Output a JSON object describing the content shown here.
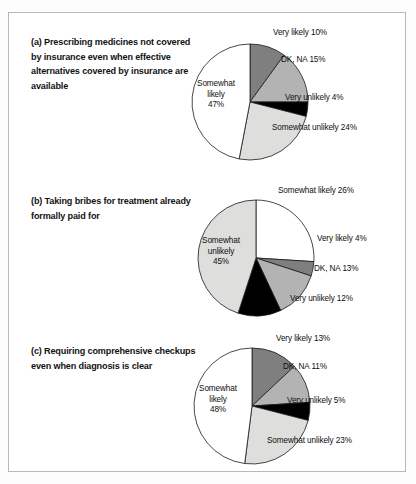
{
  "figure": {
    "panels": [
      {
        "id": "a",
        "title": "(a)  Prescribing medicines not covered by insurance even when effective alternatives covered by insurance are available",
        "inner_label_line1": "Somewhat",
        "inner_label_line2": "likely",
        "inner_label_line3": "47%",
        "labels": [
          {
            "text": "Very likely 10%"
          },
          {
            "text": "DK, NA 15%"
          },
          {
            "text": "Very unlikely 4%"
          },
          {
            "text": "Somewhat unlikely 24%"
          }
        ]
      },
      {
        "id": "b",
        "title": "(b)  Taking bribes for treatment already formally paid for",
        "inner_label_line1": "Somewhat",
        "inner_label_line2": "unlikely",
        "inner_label_line3": "45%",
        "labels": [
          {
            "text": "Somewhat likely 26%"
          },
          {
            "text": "Very likely 4%"
          },
          {
            "text": "DK, NA 13%"
          },
          {
            "text": "Very unlikely 12%"
          }
        ]
      },
      {
        "id": "c",
        "title": "(c)  Requiring comprehensive checkups even when diagnosis is clear",
        "inner_label_line1": "Somewhat",
        "inner_label_line2": "likely",
        "inner_label_line3": "48%",
        "labels": [
          {
            "text": "Very likely 13%"
          },
          {
            "text": "DK, NA 11%"
          },
          {
            "text": "Very unlikely 5%"
          },
          {
            "text": "Somewhat unlikely 23%"
          }
        ]
      }
    ]
  },
  "chart_data": [
    {
      "type": "pie",
      "title": "(a)  Prescribing medicines not covered by insurance even when effective alternatives covered by insurance are available",
      "categories": [
        "Very likely",
        "DK, NA",
        "Very unlikely",
        "Somewhat unlikely",
        "Somewhat likely"
      ],
      "values": [
        10,
        15,
        4,
        24,
        47
      ],
      "labels": [
        "Very likely 10%",
        "DK, NA 15%",
        "Very unlikely 4%",
        "Somewhat unlikely 24%",
        "Somewhat likely 47%"
      ],
      "colors": [
        "#807f7f",
        "#b4b3b3",
        "#000000",
        "#dededd",
        "#ffffff"
      ],
      "start_angle_deg": 0,
      "direction": "clockwise",
      "legend": "none"
    },
    {
      "type": "pie",
      "title": "(b)  Taking bribes for treatment already formally paid for",
      "categories": [
        "Somewhat likely",
        "Very likely",
        "DK, NA",
        "Very unlikely",
        "Somewhat unlikely"
      ],
      "values": [
        26,
        4,
        13,
        12,
        45
      ],
      "labels": [
        "Somewhat likely 26%",
        "Very likely 4%",
        "DK, NA 13%",
        "Very unlikely 12%",
        "Somewhat unlikely 45%"
      ],
      "colors": [
        "#ffffff",
        "#807f7f",
        "#b4b3b3",
        "#000000",
        "#dededd"
      ],
      "start_angle_deg": 0,
      "direction": "clockwise",
      "legend": "none"
    },
    {
      "type": "pie",
      "title": "(c)  Requiring comprehensive checkups even when diagnosis is clear",
      "categories": [
        "Very likely",
        "DK, NA",
        "Very unlikely",
        "Somewhat unlikely",
        "Somewhat likely"
      ],
      "values": [
        13,
        11,
        5,
        23,
        48
      ],
      "labels": [
        "Very likely 13%",
        "DK, NA 11%",
        "Very unlikely 5%",
        "Somewhat unlikely 23%",
        "Somewhat likely 48%"
      ],
      "colors": [
        "#807f7f",
        "#b4b3b3",
        "#000000",
        "#dededd",
        "#ffffff"
      ],
      "start_angle_deg": 0,
      "direction": "clockwise",
      "legend": "none"
    }
  ]
}
